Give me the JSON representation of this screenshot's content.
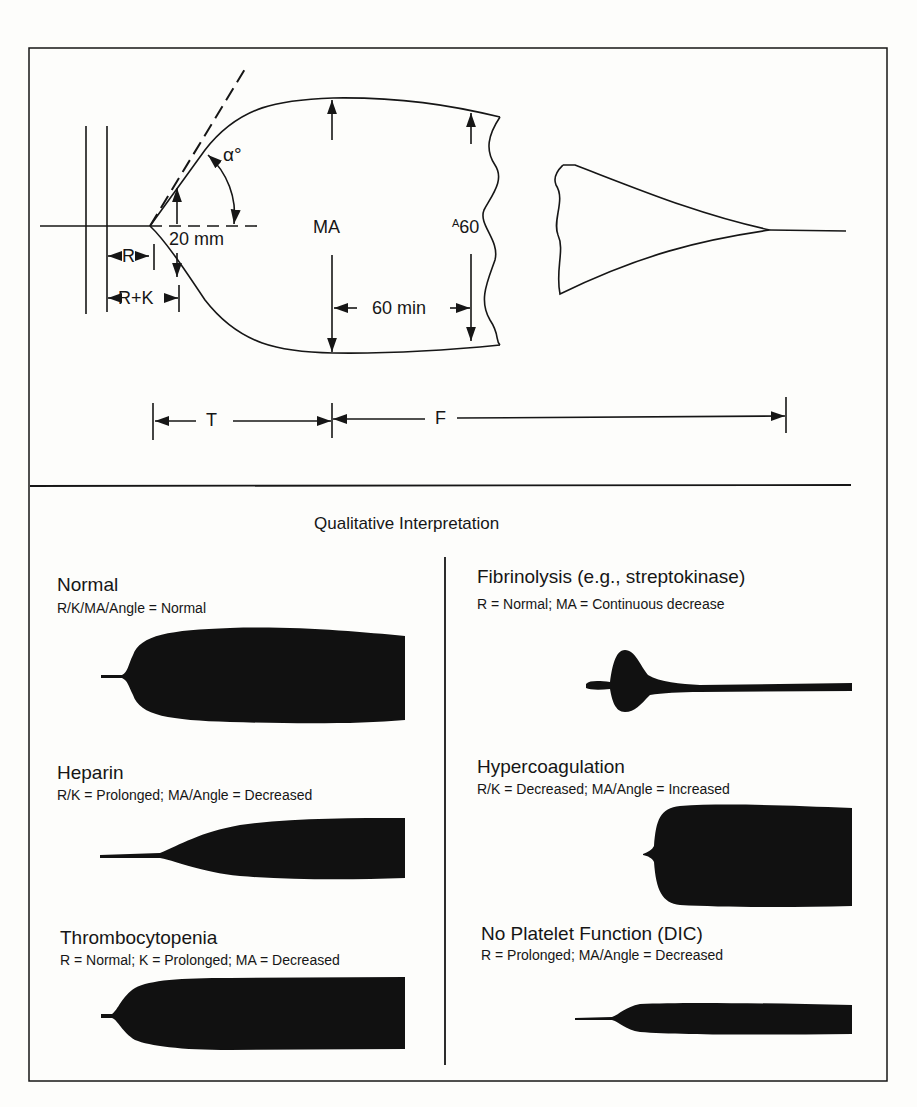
{
  "diagram": {
    "type": "thromboelastogram",
    "top_panel": {
      "labels": {
        "alpha": "α°",
        "twenty_mm": "20 mm",
        "ma": "MA",
        "a60_prefix": "A",
        "a60_suffix": "60",
        "sixty_min": "60 min",
        "r": "R",
        "r_plus_k": "R+K",
        "t": "T",
        "f": "F"
      }
    },
    "bottom_panel": {
      "title": "Qualitative Interpretation",
      "left_column": [
        {
          "name": "Normal",
          "desc": "R/K/MA/Angle = Normal"
        },
        {
          "name": "Heparin",
          "desc": "R/K = Prolonged;  MA/Angle =  Decreased"
        },
        {
          "name": "Thrombocytopenia",
          "desc": "R = Normal;  K = Prolonged;  MA = Decreased"
        }
      ],
      "right_column": [
        {
          "name": "Fibrinolysis (e.g., streptokinase)",
          "desc": "R = Normal;  MA = Continuous  decrease"
        },
        {
          "name": "Hypercoagulation",
          "desc": "R/K = Decreased;  MA/Angle = Increased"
        },
        {
          "name": "No Platelet Function (DIC)",
          "desc": "R = Prolonged;  MA/Angle =  Decreased"
        }
      ]
    },
    "colors": {
      "ink": "#161616",
      "paper": "#fdfdfb"
    }
  }
}
